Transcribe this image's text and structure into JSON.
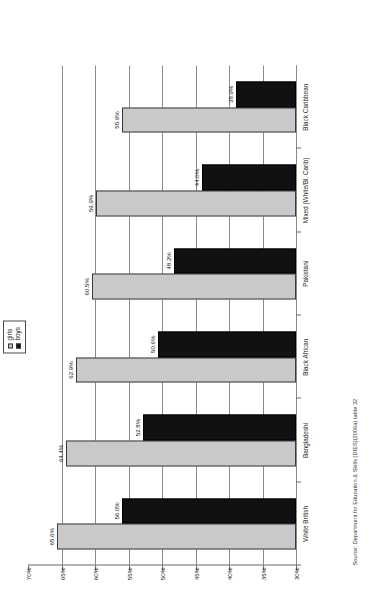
{
  "figure": {
    "source_note": "Source: Department for Education & Skills (DfES)(2006a) table 32",
    "legend": {
      "girls_label": "girls",
      "boys_label": "boys",
      "girls_color": "#c9c9c9",
      "boys_color": "#111111"
    }
  },
  "chart_data": {
    "type": "bar",
    "title": "",
    "xlabel": "",
    "ylabel": "",
    "orientation": "vertical-rendered-rotated",
    "grid": true,
    "legend_position": "top-center",
    "ylim": [
      30,
      70
    ],
    "y_inverted": true,
    "yticks": [
      70,
      65,
      60,
      55,
      50,
      45,
      40,
      35,
      30
    ],
    "ytick_labels": [
      "70%",
      "65%",
      "60%",
      "55%",
      "50%",
      "45%",
      "40%",
      "35%",
      "30%"
    ],
    "categories": [
      "White British",
      "Bangladeshi",
      "Black African",
      "Pakistani",
      "Mixed (White/Bl. Carib)",
      "Black Caribbean"
    ],
    "series": [
      {
        "name": "girls",
        "color": "#c9c9c9",
        "values": [
          65.6,
          64.4,
          62.9,
          60.5,
          59.9,
          55.9
        ],
        "value_labels": [
          "65.6%",
          "64.4%",
          "62.9%",
          "60.5%",
          "59.9%",
          "55.9%"
        ]
      },
      {
        "name": "boys",
        "color": "#111111",
        "values": [
          56.0,
          52.8,
          50.6,
          48.2,
          44.0,
          38.9
        ],
        "value_labels": [
          "56.0%",
          "52.8%",
          "50.6%",
          "48.2%",
          "44.0%",
          "38.9%"
        ]
      }
    ]
  }
}
